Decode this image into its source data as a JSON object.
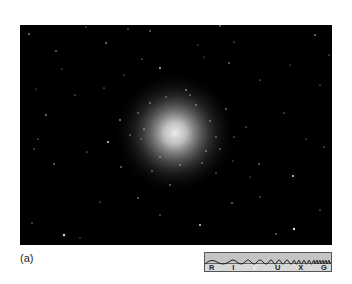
{
  "figure": {
    "caption_label": "(a)",
    "image_description": "Globular star cluster against black sky",
    "background_color": "#000000",
    "cluster_center": [
      155,
      108
    ],
    "cluster_core_color": "#e8e8e8"
  },
  "spectrum_bar": {
    "bands": [
      {
        "label": "R",
        "active": false
      },
      {
        "label": "I",
        "active": false
      },
      {
        "label": "V",
        "active": true
      },
      {
        "label": "U",
        "active": false
      },
      {
        "label": "X",
        "active": false
      },
      {
        "label": "G",
        "active": false
      }
    ],
    "active_band": "V"
  }
}
